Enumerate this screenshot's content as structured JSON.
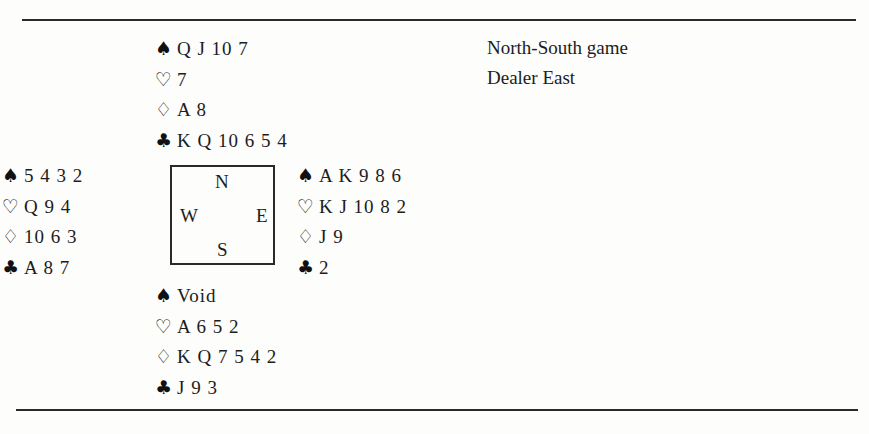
{
  "info": {
    "vulnerability": "North-South game",
    "dealer": "Dealer East"
  },
  "compass": {
    "north": "N",
    "south": "S",
    "west": "W",
    "east": "E"
  },
  "suit_symbols": {
    "spades": "♠",
    "hearts": "♡",
    "diamonds": "♢",
    "clubs": "♣"
  },
  "hands": {
    "north": {
      "spades": "Q J 10 7",
      "hearts": "7",
      "diamonds": "A 8",
      "clubs": "K Q 10 6 5 4"
    },
    "west": {
      "spades": "5 4 3 2",
      "hearts": "Q 9 4",
      "diamonds": "10 6 3",
      "clubs": "A 8 7"
    },
    "east": {
      "spades": "A K 9 8 6",
      "hearts": "K J 10 8 2",
      "diamonds": "J 9",
      "clubs": "2"
    },
    "south": {
      "spades": "Void",
      "hearts": "A 6 5 2",
      "diamonds": "K Q 7 5 4 2",
      "clubs": "J 9 3"
    }
  }
}
